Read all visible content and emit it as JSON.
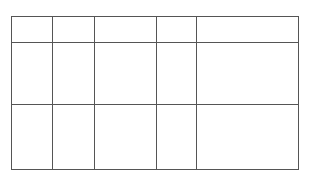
{
  "table": {
    "columns": 5,
    "rows": 3,
    "cells": [
      [
        "",
        "",
        "",
        "",
        ""
      ],
      [
        "",
        "",
        "",
        "",
        ""
      ],
      [
        "",
        "",
        "",
        "",
        ""
      ]
    ],
    "border_color": "#555555"
  }
}
